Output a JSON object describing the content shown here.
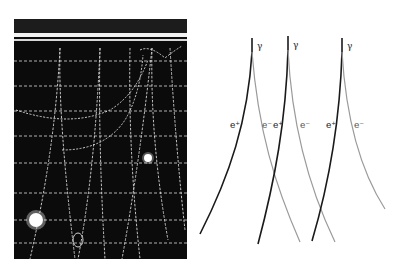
{
  "figure": {
    "photo": {
      "description": "Bubble chamber photograph showing electron-positron pair production tracks",
      "background_color": "#0a0a0a",
      "track_color": "#e8e8e8"
    },
    "diagram": {
      "colors": {
        "positron_track": "#1a1a1a",
        "electron_track": "#9a9a9a",
        "label": "#222222"
      },
      "pairs": [
        {
          "photon_label": "γ",
          "positron_label": "e⁺",
          "electron_label": "e⁻"
        },
        {
          "photon_label": "γ",
          "positron_label": "e⁺",
          "electron_label": "e⁻"
        },
        {
          "photon_label": "γ",
          "positron_label": "e⁺",
          "electron_label": "e⁻"
        }
      ]
    }
  }
}
